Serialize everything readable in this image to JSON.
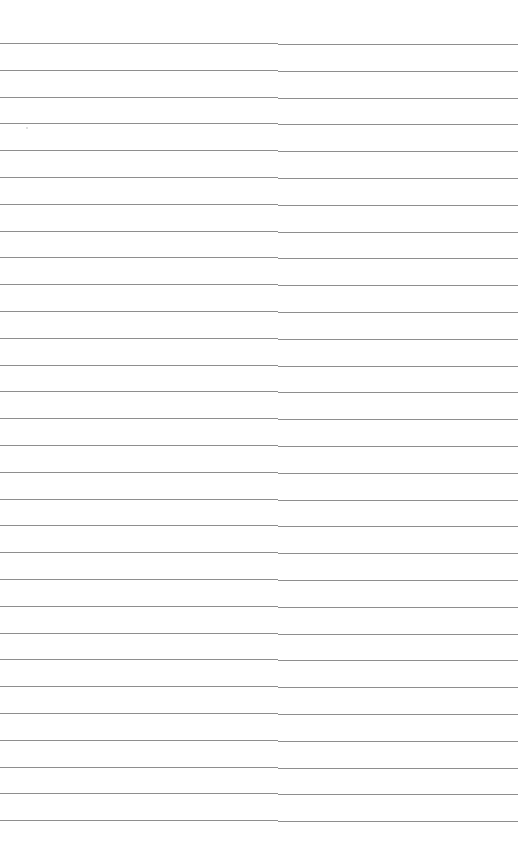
{
  "document": {
    "type": "lined-paper",
    "background_color": "#ffffff",
    "line_color": "#7a7a7a",
    "line_count": 30,
    "first_line_y": 43,
    "line_spacing": 26.8
  }
}
